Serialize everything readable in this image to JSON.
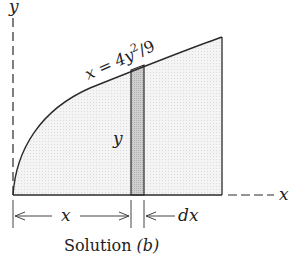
{
  "diagram": {
    "axis_y_label": "y",
    "axis_x_label": "x",
    "curve_label_lhs": "x = 4y",
    "curve_label_exp": "2",
    "curve_label_rhs": "/9",
    "strip_height_label": "y",
    "dim_x_label": "x",
    "dim_dx_label": "dx",
    "caption_text": "Solution ",
    "caption_part": "(b)",
    "colors": {
      "line": "#2a2a2a",
      "region_fill": "#f1f1f1",
      "strip_fill": "#c8c8c8"
    }
  }
}
